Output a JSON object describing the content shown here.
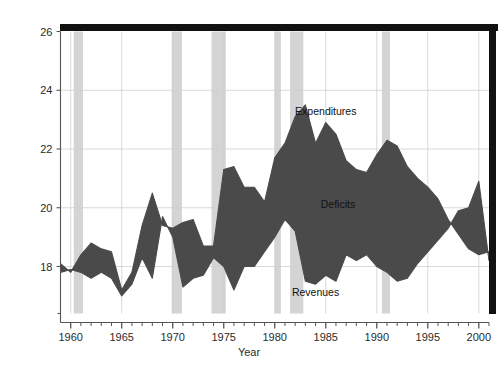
{
  "chart_data": {
    "type": "area",
    "title": "",
    "subtitle": "",
    "xlabel": "Year",
    "ylabel": "",
    "xlim": [
      1959,
      2001
    ],
    "ylim": [
      16.4,
      26
    ],
    "grid": true,
    "legend_position": "inline-annotations",
    "x_tick_labels": [
      "1960",
      "1965",
      "1970",
      "1975",
      "1980",
      "1985",
      "1990",
      "1995",
      "2000"
    ],
    "x_ticks": [
      1960,
      1965,
      1970,
      1975,
      1980,
      1985,
      1990,
      1995,
      2000
    ],
    "x_minor_tick_step": 1,
    "y_tick_labels": [
      "18",
      "20",
      "22",
      "24",
      "26"
    ],
    "y_ticks": [
      18,
      20,
      22,
      24,
      26
    ],
    "annotations": [
      {
        "text": "Expenditures",
        "x": 1985.0,
        "y": 23.15
      },
      {
        "text": "Deficits",
        "x": 1986.2,
        "y": 20.0
      },
      {
        "text": "Revenues",
        "x": 1984.0,
        "y": 17.0
      }
    ],
    "x": [
      1959,
      1960,
      1961,
      1962,
      1963,
      1964,
      1965,
      1966,
      1967,
      1968,
      1969,
      1970,
      1971,
      1972,
      1973,
      1974,
      1975,
      1976,
      1977,
      1978,
      1979,
      1980,
      1981,
      1982,
      1983,
      1984,
      1985,
      1986,
      1987,
      1988,
      1989,
      1990,
      1991,
      1992,
      1993,
      1994,
      1995,
      1996,
      1997,
      1998,
      1999,
      2000,
      2001
    ],
    "series": [
      {
        "name": "Expenditures",
        "color": "#4a4a4a",
        "values": [
          18.1,
          17.8,
          18.4,
          18.8,
          18.6,
          18.5,
          17.2,
          17.8,
          19.4,
          20.5,
          19.4,
          19.3,
          19.5,
          19.6,
          18.7,
          18.7,
          21.3,
          21.4,
          20.7,
          20.7,
          20.2,
          21.7,
          22.2,
          23.1,
          23.5,
          22.2,
          22.9,
          22.5,
          21.6,
          21.3,
          21.2,
          21.8,
          22.3,
          22.1,
          21.4,
          21.0,
          20.7,
          20.3,
          19.6,
          19.1,
          18.6,
          18.4,
          18.5
        ],
        "ylim_units": "percent of GDP"
      },
      {
        "name": "Revenues",
        "color": "#4a4a4a",
        "values": [
          17.8,
          17.9,
          17.8,
          17.6,
          17.8,
          17.6,
          17.0,
          17.4,
          18.3,
          17.6,
          19.7,
          19.0,
          17.3,
          17.6,
          17.7,
          18.3,
          18.0,
          17.2,
          18.0,
          18.0,
          18.5,
          19.0,
          19.6,
          19.2,
          17.5,
          17.4,
          17.7,
          17.5,
          18.4,
          18.2,
          18.4,
          18.0,
          17.8,
          17.5,
          17.6,
          18.1,
          18.5,
          18.9,
          19.3,
          19.9,
          20.0,
          20.9,
          18.2
        ],
        "ylim_units": "percent of GDP"
      }
    ],
    "shaded_regions": {
      "name": "recession-bands",
      "color": "#d4d4d4",
      "bands": [
        [
          1960.3,
          1961.2
        ],
        [
          1969.9,
          1970.9
        ],
        [
          1973.8,
          1975.2
        ],
        [
          1980.0,
          1980.6
        ],
        [
          1981.5,
          1982.8
        ],
        [
          1990.5,
          1991.3
        ]
      ]
    },
    "top_border": {
      "name": "top-rule",
      "color": "#111111"
    },
    "right_border": {
      "name": "right-rule",
      "color": "#111111"
    }
  }
}
